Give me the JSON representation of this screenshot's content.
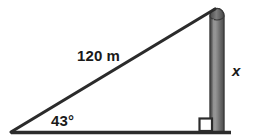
{
  "figure": {
    "kind": "right-triangle-diagram",
    "background_color": "#ffffff",
    "line_color": "#2b2b2b",
    "text_color": "#1a1a1a",
    "pole": {
      "fill_light": "#8c8c8c",
      "fill_mid": "#6e6e6e",
      "fill_dark": "#4a4a4a",
      "edge_color": "#3a3a3a"
    },
    "labels": {
      "hypotenuse": "120 m",
      "angle": "43°",
      "opposite": "x"
    },
    "geometry": {
      "left_vertex": [
        11,
        132
      ],
      "top_vertex": [
        214,
        9
      ],
      "right_vertex": [
        214,
        132
      ],
      "baseline_start_x": 11,
      "baseline_end_x": 231,
      "baseline_y": 132,
      "pole_left_x": 210,
      "pole_right_x": 224,
      "pole_top_y": 8,
      "pole_bottom_y": 133,
      "right_angle_marker": [
        199,
        118,
        13,
        13
      ]
    }
  }
}
